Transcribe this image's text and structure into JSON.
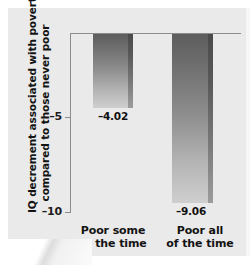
{
  "chart_data": {
    "type": "bar",
    "title": "",
    "categories": [
      "Poor some of the time",
      "Poor all of the time"
    ],
    "category_lines": [
      [
        "Poor some",
        "of the time"
      ],
      [
        "Poor all",
        "of the time"
      ]
    ],
    "values": [
      -4.02,
      -9.06
    ],
    "data_labels": [
      "–4.02",
      "–9.06"
    ],
    "xlabel": "",
    "ylabel": "IQ decrement associated with poverty compared to those never poor",
    "ylabel_lines": [
      "IQ decrement associated with poverty",
      "compared to those never poor"
    ],
    "ylim": [
      -10,
      0
    ],
    "yticks": [
      -5,
      -10
    ],
    "ytick_labels": [
      "–5",
      "–10"
    ],
    "grid": false,
    "legend": null,
    "colors": {
      "background": "#ebeaea",
      "bar_top": "#5d5d5d",
      "bar_bottom": "#cfcfcf",
      "bar_shadow": "#4a4a4a",
      "axis": "#8c8c8c",
      "text": "#131313"
    }
  }
}
